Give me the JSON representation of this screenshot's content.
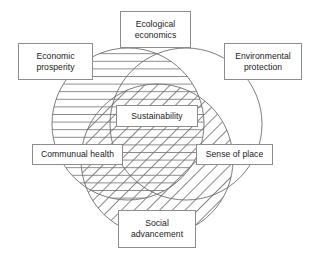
{
  "diagram": {
    "type": "venn-three-circle",
    "title": "Sustainability",
    "background_color": "#ffffff",
    "stroke_color": "#6e6e6e",
    "box_border_color": "#8c8c8c",
    "box_fill_color": "#ffffff",
    "text_color": "#1a1a1a",
    "circles": [
      {
        "id": "economic",
        "label": "Economic prosperity",
        "fill_pattern": "horizontal-lines",
        "cx": 128,
        "cy": 124,
        "r": 76
      },
      {
        "id": "environmental",
        "label": "Environmental protection",
        "fill_pattern": "none",
        "cx": 186,
        "cy": 124,
        "r": 76
      },
      {
        "id": "social",
        "label": "Social advancement",
        "fill_pattern": "diagonal-lines",
        "cx": 157,
        "cy": 160,
        "r": 76
      }
    ],
    "labels": {
      "ecological_economics": "Ecological\neconomics",
      "economic_prosperity": "Economic\nprosperity",
      "environmental_protection": "Environmental\nprotection",
      "sustainability": "Sustainability",
      "communual_health": "Communual health",
      "sense_of_place": "Sense of place",
      "social_advancement": "Social\nadvancement"
    }
  }
}
